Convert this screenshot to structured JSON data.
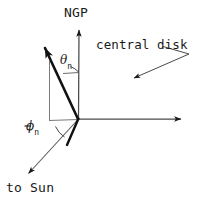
{
  "figure": {
    "type": "vector-geometry-diagram",
    "background_color": "#ffffff",
    "line_color": "#1a1a1a",
    "axes": [
      {
        "name": "ngp-axis",
        "label": "NGP",
        "direction": "up",
        "origin": [
          78,
          119
        ],
        "tip": [
          79,
          24
        ],
        "style": "thin-arrow"
      },
      {
        "name": "disk-axis",
        "label": "",
        "direction": "right",
        "origin": [
          78,
          119
        ],
        "tip": [
          188,
          119
        ],
        "style": "thin-arrow"
      },
      {
        "name": "sun-axis",
        "label": "to Sun",
        "direction": "down-left",
        "origin": [
          78,
          119
        ],
        "tip": [
          23,
          178
        ],
        "style": "thin-arrow"
      }
    ],
    "vectors": [
      {
        "name": "n-vector",
        "origin": [
          78,
          119
        ],
        "tip": [
          40,
          38
        ],
        "style": "thick-arrow"
      },
      {
        "name": "n-vector-projection",
        "origin": [
          78,
          119
        ],
        "tip": [
          67,
          145
        ],
        "style": "thick-line"
      }
    ],
    "construction_lines": [
      {
        "name": "vertical-dropline",
        "from": [
          49,
          62
        ],
        "to": [
          49,
          120
        ]
      },
      {
        "name": "horizontal-baseline",
        "from": [
          49,
          120
        ],
        "to": [
          78,
          119
        ]
      }
    ],
    "angles": [
      {
        "name": "theta-n",
        "symbol": "θ",
        "subscript": "n",
        "vertex": [
          78,
          119
        ],
        "label_position": [
          60,
          54
        ]
      },
      {
        "name": "minus-phi-n",
        "symbol": "φ",
        "subscript": "n",
        "prefix": "−",
        "vertex": [
          78,
          119
        ],
        "label_position": [
          26,
          120
        ]
      }
    ],
    "annotations": [
      {
        "name": "central-disk-callout",
        "text": "central disk",
        "text_position": [
          96,
          39
        ],
        "leader_from": [
          164,
          46
        ],
        "leader_corner": [
          186,
          52
        ],
        "arrow_to": [
          130,
          80
        ]
      }
    ]
  },
  "labels": {
    "ngp": "NGP",
    "central_disk": "central disk",
    "to_sun": "to Sun",
    "theta_symbol": "θ",
    "theta_subscript": "n",
    "phi_minus_sign": "−",
    "phi_symbol": "ϕ",
    "phi_subscript": "n"
  }
}
